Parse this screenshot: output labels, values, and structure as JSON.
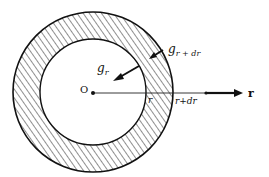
{
  "diagram": {
    "type": "annular shell gravitational field",
    "center_label": "O",
    "inner_field_label": "g",
    "inner_field_sub": "r",
    "outer_field_label": "g",
    "outer_field_sub": "r + dr",
    "inner_radius_label": "r",
    "outer_radius_label": "r+dr",
    "axis_label": "r",
    "colors": {
      "stroke": "#111111",
      "background": "#ffffff"
    }
  }
}
